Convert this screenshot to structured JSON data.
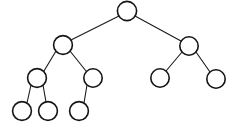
{
  "diagram": {
    "type": "binary-tree",
    "background_color": "#ffffff",
    "node_fill_color": "#ffffff",
    "node_stroke_color": "#151515",
    "edge_color": "#1a1a1a",
    "node_radius": 9.2,
    "node_count": 9,
    "edge_count": 8,
    "depth": 4,
    "canvas": {
      "width": 240,
      "height": 131
    },
    "nodes": [
      {
        "id": "root",
        "label": "",
        "cx": 127,
        "cy": 11,
        "r": 9.6,
        "level": 0
      },
      {
        "id": "n-l",
        "label": "",
        "cx": 63,
        "cy": 45,
        "r": 9.4,
        "level": 1
      },
      {
        "id": "n-r",
        "label": "",
        "cx": 189,
        "cy": 46,
        "r": 9.2,
        "level": 1
      },
      {
        "id": "n-ll",
        "label": "",
        "cx": 37,
        "cy": 78,
        "r": 9.4,
        "level": 2
      },
      {
        "id": "n-lr",
        "label": "",
        "cx": 93,
        "cy": 78,
        "r": 9.2,
        "level": 2
      },
      {
        "id": "n-rl",
        "label": "",
        "cx": 160,
        "cy": 78,
        "r": 9.2,
        "level": 2
      },
      {
        "id": "n-rr",
        "label": "",
        "cx": 216,
        "cy": 79,
        "r": 9.2,
        "level": 2
      },
      {
        "id": "n-lll",
        "label": "",
        "cx": 22,
        "cy": 111,
        "r": 9.4,
        "level": 3
      },
      {
        "id": "n-llr",
        "label": "",
        "cx": 48,
        "cy": 111,
        "r": 9.4,
        "level": 3
      },
      {
        "id": "n-lrl",
        "label": "",
        "cx": 79,
        "cy": 111,
        "r": 9.4,
        "level": 3
      }
    ],
    "edges": [
      {
        "id": "edge-root-l",
        "from": "root",
        "to": "n-l",
        "x1": 119,
        "y1": 16,
        "x2": 71,
        "y2": 40
      },
      {
        "id": "edge-root-r",
        "from": "root",
        "to": "n-r",
        "x1": 135,
        "y1": 16,
        "x2": 181,
        "y2": 41
      },
      {
        "id": "edge-l-ll",
        "from": "n-l",
        "to": "n-ll",
        "x1": 56,
        "y1": 51,
        "x2": 44,
        "y2": 71
      },
      {
        "id": "edge-l-lr",
        "from": "n-l",
        "to": "n-lr",
        "x1": 70,
        "y1": 51,
        "x2": 86,
        "y2": 71
      },
      {
        "id": "edge-ll-lll",
        "from": "n-ll",
        "to": "n-lll",
        "x1": 31,
        "y1": 85,
        "x2": 27,
        "y2": 103
      },
      {
        "id": "edge-ll-llr",
        "from": "n-ll",
        "to": "n-llr",
        "x1": 43,
        "y1": 85,
        "x2": 46,
        "y2": 102
      },
      {
        "id": "edge-lr-lrl",
        "from": "n-lr",
        "to": "n-lrl",
        "x1": 87,
        "y1": 85,
        "x2": 84,
        "y2": 103
      },
      {
        "id": "edge-r-rl",
        "from": "n-r",
        "to": "n-rl",
        "x1": 182,
        "y1": 52,
        "x2": 166,
        "y2": 71
      },
      {
        "id": "edge-r-rr",
        "from": "n-r",
        "to": "n-rr",
        "x1": 196,
        "y1": 52,
        "x2": 210,
        "y2": 72
      }
    ]
  }
}
